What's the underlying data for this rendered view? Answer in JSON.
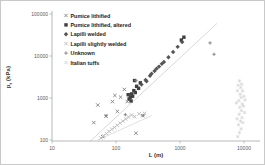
{
  "figure": {
    "background": "#ffffff",
    "border_color": "#c9c9c9"
  },
  "chart_data": {
    "type": "scatter",
    "title": "",
    "xlabel": "L (m)",
    "ylabel": "pt (kPa)",
    "ylabel_parts": {
      "main": "p",
      "sub": "t",
      "unit": " (kPa)"
    },
    "x_scale": "log",
    "y_scale": "log",
    "xlim": [
      10,
      20000
    ],
    "ylim": [
      100,
      100000
    ],
    "x_ticks": [
      10,
      100,
      1000,
      10000
    ],
    "y_ticks": [
      100,
      1000,
      10000,
      100000
    ],
    "grid": false,
    "legend_position": "top-left-inside",
    "axis_color": "#a6a6a6",
    "tick_label_color": "#595959",
    "legend_text_color": "#1a1a1a",
    "series": [
      {
        "name": "Pumice lithified",
        "marker": "x",
        "color": "#808080",
        "points": [
          [
            45,
            260
          ],
          [
            52,
            680
          ],
          [
            62,
            120
          ],
          [
            70,
            370
          ],
          [
            88,
            820
          ],
          [
            105,
            480
          ],
          [
            118,
            1050
          ],
          [
            150,
            820
          ],
          [
            205,
            145
          ],
          [
            262,
            380
          ],
          [
            96,
            1150
          ],
          [
            135,
            1600
          ]
        ]
      },
      {
        "name": "Pumice lithified, altered",
        "marker": "square",
        "color": "#3f3f3f",
        "points": [
          [
            160,
            950
          ],
          [
            168,
            1050
          ],
          [
            175,
            1250
          ],
          [
            182,
            1100
          ],
          [
            190,
            1500
          ],
          [
            200,
            1350
          ],
          [
            210,
            1900
          ],
          [
            225,
            1700
          ],
          [
            240,
            2300
          ],
          [
            172,
            850
          ],
          [
            195,
            2600
          ],
          [
            155,
            1200
          ],
          [
            1050,
            24000
          ],
          [
            1150,
            28000
          ]
        ]
      },
      {
        "name": "Lapilli welded",
        "marker": "diamond",
        "color": "#555555",
        "points": [
          [
            250,
            2100
          ],
          [
            290,
            2700
          ],
          [
            340,
            3400
          ],
          [
            400,
            4400
          ],
          [
            470,
            5600
          ],
          [
            560,
            7200
          ],
          [
            660,
            9300
          ],
          [
            780,
            12500
          ],
          [
            920,
            16500
          ],
          [
            1080,
            21500
          ],
          [
            300,
            2500
          ],
          [
            360,
            3800
          ],
          [
            430,
            5000
          ],
          [
            520,
            6500
          ]
        ]
      },
      {
        "name": "Lapilli slightly welded",
        "marker": "x",
        "color": "#b8b8b8",
        "points": [
          [
            58,
            112
          ],
          [
            64,
            126
          ],
          [
            71,
            142
          ],
          [
            78,
            160
          ],
          [
            86,
            180
          ],
          [
            95,
            200
          ],
          [
            105,
            225
          ],
          [
            116,
            252
          ],
          [
            128,
            282
          ],
          [
            142,
            316
          ],
          [
            157,
            352
          ],
          [
            174,
            392
          ],
          [
            195,
            360
          ],
          [
            230,
            420
          ],
          [
            280,
            430
          ]
        ]
      },
      {
        "name": "Unknown",
        "marker": "plus",
        "color": "#7f7f7f",
        "points": [
          [
            70,
            380
          ],
          [
            140,
            400
          ],
          [
            265,
            385
          ],
          [
            2950,
            20500
          ],
          [
            3400,
            11000
          ],
          [
            205,
            2600
          ]
        ]
      },
      {
        "name": "Italian tuffs",
        "marker": "asterisk",
        "color": "#d4d4d4",
        "points": [
          [
            8000,
            120
          ],
          [
            8500,
            150
          ],
          [
            9000,
            185
          ],
          [
            8200,
            230
          ],
          [
            8800,
            280
          ],
          [
            9300,
            340
          ],
          [
            8400,
            410
          ],
          [
            9100,
            500
          ],
          [
            8600,
            600
          ],
          [
            9400,
            720
          ],
          [
            8300,
            860
          ],
          [
            9000,
            1030
          ],
          [
            8700,
            1230
          ],
          [
            9500,
            1480
          ],
          [
            8900,
            1780
          ],
          [
            9200,
            2130
          ],
          [
            8500,
            2550
          ],
          [
            9600,
            260
          ],
          [
            7800,
            320
          ],
          [
            9800,
            640
          ],
          [
            7600,
            760
          ],
          [
            10200,
            450
          ],
          [
            10000,
            1100
          ],
          [
            7900,
            1500
          ],
          [
            10400,
            900
          ],
          [
            8100,
            2000
          ]
        ]
      }
    ],
    "trendlines": [
      {
        "from": [
          40,
          95
        ],
        "to": [
          3800,
          60000
        ],
        "color": "#cfcfcf"
      },
      {
        "from": [
          52,
          100
        ],
        "to": [
          360,
          380
        ],
        "color": "#d8d8d8"
      }
    ]
  }
}
